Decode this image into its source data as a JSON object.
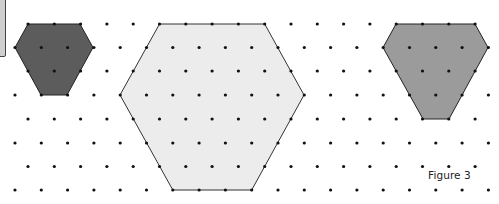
{
  "figure": {
    "caption": "Figure 3",
    "width": 499,
    "height": 204
  },
  "grid": {
    "type": "triangular-dot-lattice",
    "rows_y": [
      24,
      47.5,
      71,
      95,
      119,
      143,
      166.5,
      190
    ],
    "odd_row_start_x": 28,
    "even_row_start_x": 15,
    "spacing_x": 26.3,
    "dot_radius": 1.6,
    "dot_color": "#111111"
  },
  "shapes": [
    {
      "name": "small-dark-hexagon",
      "fill": "#5c5c5c",
      "stroke": "#222222",
      "points": [
        [
          28,
          24
        ],
        [
          80,
          24
        ],
        [
          93,
          47.5
        ],
        [
          67,
          95
        ],
        [
          41,
          95
        ],
        [
          15,
          47.5
        ]
      ]
    },
    {
      "name": "large-light-hexagon",
      "fill": "#ececec",
      "stroke": "#333333",
      "points": [
        [
          159.5,
          24
        ],
        [
          264.7,
          24
        ],
        [
          304,
          95
        ],
        [
          251.7,
          190
        ],
        [
          172.8,
          190
        ],
        [
          120,
          95
        ]
      ]
    },
    {
      "name": "medium-grey-hexagon",
      "fill": "#9b9b9b",
      "stroke": "#222222",
      "points": [
        [
          396,
          24
        ],
        [
          475,
          24
        ],
        [
          488,
          47.5
        ],
        [
          449,
          119
        ],
        [
          423,
          119
        ],
        [
          383,
          47.5
        ]
      ]
    }
  ]
}
